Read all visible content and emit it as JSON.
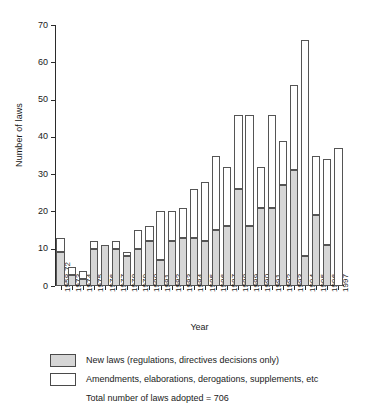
{
  "chart_data": {
    "type": "bar",
    "stacked": true,
    "title": "",
    "xlabel": "Year",
    "ylabel": "Number of laws",
    "ylim": [
      0,
      70
    ],
    "yticks": [
      0,
      10,
      20,
      30,
      40,
      50,
      60,
      70
    ],
    "grid": false,
    "legend_position": "below-axes",
    "categories": [
      "1958-72",
      "1973",
      "1974",
      "1975",
      "1976",
      "1977",
      "1978",
      "1979",
      "1980",
      "1981",
      "1982",
      "1983",
      "1984",
      "1985",
      "1986",
      "1987",
      "1988",
      "1989",
      "1990",
      "1991",
      "1992",
      "1993",
      "1994",
      "1995",
      "1996",
      "1997"
    ],
    "series": [
      {
        "name": "New laws (regulations, directives decisions only)",
        "color": "#d6d6d6",
        "values": [
          9,
          3,
          2,
          10,
          11,
          10,
          8,
          10,
          12,
          7,
          12,
          13,
          13,
          12,
          15,
          16,
          26,
          16,
          21,
          21,
          27,
          31,
          8,
          19,
          11,
          0
        ]
      },
      {
        "name": "Amendments, elaborations, derogations, supplements, etc",
        "color": "#ffffff",
        "values": [
          4,
          2,
          2,
          2,
          0,
          2,
          1,
          5,
          4,
          13,
          8,
          8,
          13,
          16,
          20,
          16,
          20,
          30,
          11,
          25,
          12,
          23,
          58,
          16,
          23,
          37
        ]
      }
    ],
    "totals": [
      13,
      5,
      4,
      12,
      11,
      12,
      9,
      15,
      16,
      20,
      20,
      21,
      26,
      28,
      35,
      32,
      46,
      46,
      32,
      46,
      39,
      54,
      66,
      35,
      34,
      37
    ],
    "annotation": "Total number of laws adopted = 706"
  },
  "legend": {
    "items": [
      {
        "swatch": "filled-gray",
        "label": "New laws (regulations, directives decisions only)"
      },
      {
        "swatch": "outline-white",
        "label": "Amendments, elaborations, derogations, supplements, etc"
      }
    ],
    "total_text": "Total number of laws adopted = 706"
  }
}
